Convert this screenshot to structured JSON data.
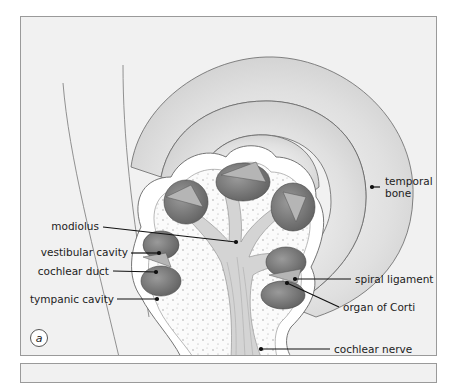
{
  "figure": {
    "panel_label": "a",
    "labels": {
      "modiolus": "modiolus",
      "vestibular_cavity": "vestibular cavity",
      "cochlear_duct": "cochlear duct",
      "tympanic_cavity": "tympanic cavity",
      "temporal_bone": "temporal bone",
      "temporal_bone_line1": "temporal",
      "temporal_bone_line2": "bone",
      "spiral_ligament": "spiral ligament",
      "organ_of_corti": "organ of Corti",
      "cochlear_nerve": "cochlear nerve"
    },
    "colors": {
      "background": "#f1f1f1",
      "bone_light": "#e6e6e6",
      "bone_shadow": "#c4c4c4",
      "cavity_dark": "#6e6e6e",
      "cavity_mid": "#8a8a8a",
      "outline": "#555555",
      "leader": "#111111"
    }
  }
}
